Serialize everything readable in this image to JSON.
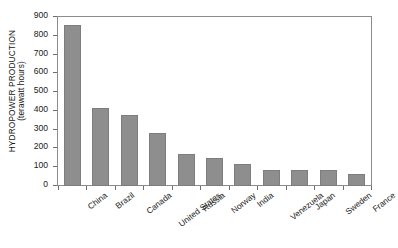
{
  "chart_data": {
    "type": "bar",
    "title": "",
    "xlabel": "",
    "ylabel_line1": "HYDROPOWER PRODUCTION",
    "ylabel_line2": "(terawatt hours)",
    "categories": [
      "China",
      "Brazil",
      "Canada",
      "United States",
      "Russia",
      "Norway",
      "India",
      "Venezuela",
      "Japan",
      "Sweden",
      "France"
    ],
    "values": [
      855,
      415,
      378,
      280,
      168,
      147,
      119,
      86,
      84,
      84,
      64
    ],
    "ylim": [
      0,
      900
    ],
    "yticks": [
      0,
      100,
      200,
      300,
      400,
      500,
      600,
      700,
      800,
      900
    ],
    "ytick_labels": [
      "0",
      "100",
      "200",
      "300",
      "400",
      "500",
      "600",
      "700",
      "800",
      "900"
    ],
    "grid": false,
    "legend": "none",
    "bar_color": "#8e8e8e",
    "axis_color": "#8c8c8c",
    "background_color": "#ffffff"
  }
}
